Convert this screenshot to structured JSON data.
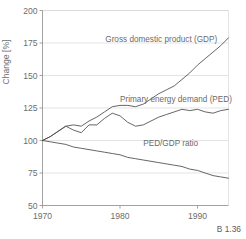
{
  "figure": {
    "number": "B 1.36",
    "background": "#ffffff",
    "line_color": "#4a4a4a",
    "grid_color": "#d9d9d9",
    "text_color": "#6d6d6d"
  },
  "chart_data": {
    "type": "line",
    "title": "",
    "xlabel": "",
    "ylabel": "Change [%]",
    "xlim": [
      1970,
      1994
    ],
    "ylim": [
      50,
      200
    ],
    "grid": true,
    "legend": "inline-annotations",
    "yticks": [
      50,
      75,
      100,
      125,
      150,
      175,
      200
    ],
    "ytick_labels": [
      "50",
      "75",
      "100",
      "125",
      "150",
      "175",
      "200"
    ],
    "xticks": [
      1970,
      1980,
      1990
    ],
    "xtick_labels": [
      "1970",
      "1980",
      "1990"
    ],
    "x": [
      1970,
      1971,
      1972,
      1973,
      1974,
      1975,
      1976,
      1977,
      1978,
      1979,
      1980,
      1981,
      1982,
      1983,
      1984,
      1985,
      1986,
      1987,
      1988,
      1989,
      1990,
      1991,
      1992,
      1993,
      1994
    ],
    "series": [
      {
        "name": "Gross domestic product (GDP)",
        "label": "Gross domestic product (GDP)",
        "label_x": 1978.1,
        "label_y": 176.0,
        "values": [
          100,
          103,
          107,
          111,
          112,
          111,
          115,
          118,
          122,
          126,
          127,
          127,
          126,
          128,
          132,
          136,
          139,
          142,
          147,
          152,
          158,
          163,
          168,
          173,
          179
        ]
      },
      {
        "name": "Primary energy demand (PED)",
        "label": "Primary energy demand (PED)",
        "label_x": 1980.0,
        "label_y": 130.0,
        "values": [
          100,
          103,
          107,
          111,
          108,
          106,
          112,
          112,
          117,
          121,
          119,
          114,
          111,
          112,
          115,
          118,
          120,
          122,
          124,
          123,
          124,
          122,
          121,
          123,
          124
        ]
      },
      {
        "name": "PED/GDP ratio",
        "label": "PED/GDP ratio",
        "label_x": 1983.0,
        "label_y": 96.0,
        "values": [
          100,
          99,
          98,
          97,
          95,
          94,
          93,
          92,
          91,
          90,
          89,
          87,
          86,
          85,
          84,
          83,
          82,
          81,
          80,
          78,
          77,
          75,
          73,
          72,
          71
        ]
      }
    ]
  }
}
